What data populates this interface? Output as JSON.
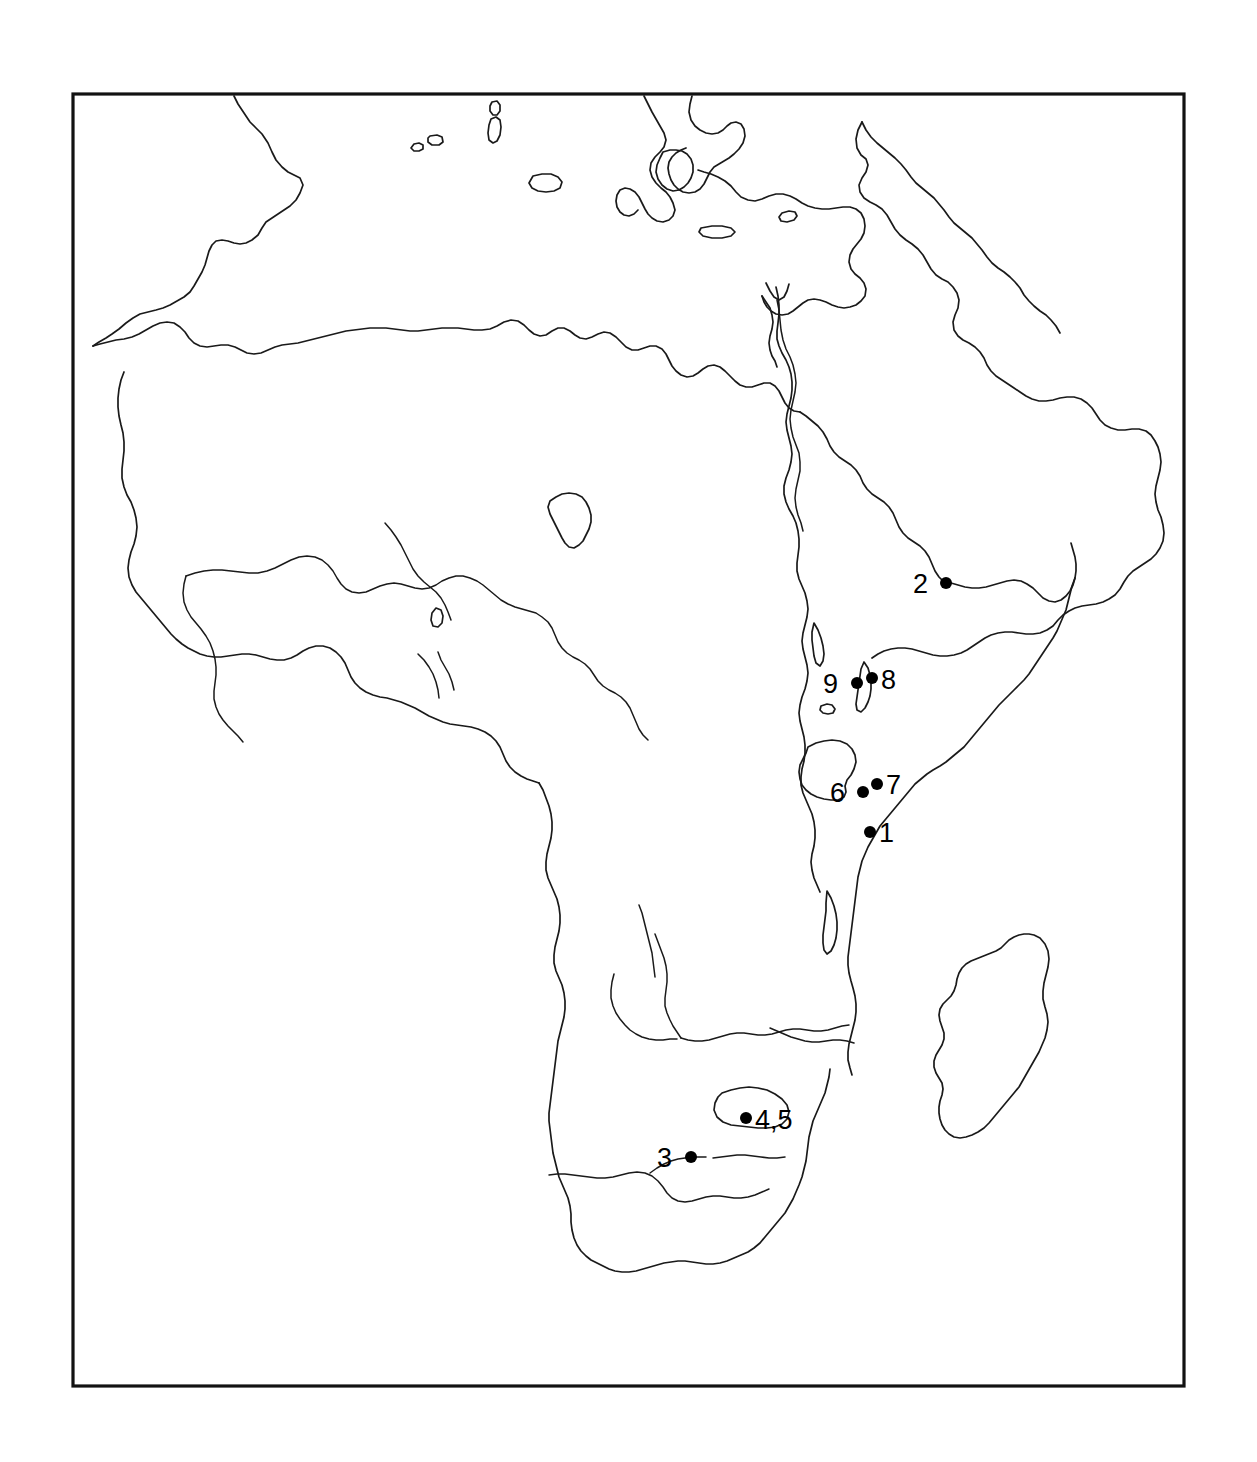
{
  "figure": {
    "frame": {
      "x": 73,
      "y": 94,
      "width": 1111,
      "height": 1292,
      "stroke_color": "#121212"
    },
    "background_color": "#ffffff",
    "line_color": "#1a1a1a"
  },
  "map": {
    "region": "Africa",
    "projection_style": "outline",
    "features": {
      "continents": [
        "Africa",
        "Arabia",
        "southern Europe",
        "Anatolia",
        "Levant"
      ],
      "islands": [
        "Madagascar",
        "Sicily",
        "Crete",
        "Cyprus",
        "Sardinia",
        "Corsica",
        "Balearics"
      ],
      "lakes": [
        "Lake Chad",
        "Lake Victoria",
        "Lake Tanganyika",
        "Lake Malawi",
        "Lake Turkana",
        "Lake Kyoga"
      ],
      "rivers": [
        "Nile",
        "Niger",
        "Congo",
        "Zambezi",
        "Orange",
        "Limpopo"
      ]
    }
  },
  "sites": [
    {
      "id": "site-1",
      "label": "1",
      "dot_x": 870,
      "dot_y": 832,
      "label_x": 879,
      "label_y": 842,
      "label_side": "right"
    },
    {
      "id": "site-2",
      "label": "2",
      "dot_x": 946,
      "dot_y": 583,
      "label_x": 928,
      "label_y": 593,
      "label_side": "left"
    },
    {
      "id": "site-3",
      "label": "3",
      "dot_x": 691,
      "dot_y": 1157,
      "label_x": 672,
      "label_y": 1167,
      "label_side": "left"
    },
    {
      "id": "site-4-5",
      "label": "4,5",
      "dot_x": 746,
      "dot_y": 1118,
      "label_x": 755,
      "label_y": 1129,
      "label_side": "right"
    },
    {
      "id": "site-6",
      "label": "6",
      "dot_x": 863,
      "dot_y": 792,
      "label_x": 845,
      "label_y": 802,
      "label_side": "left"
    },
    {
      "id": "site-7",
      "label": "7",
      "dot_x": 877,
      "dot_y": 784,
      "label_x": 886,
      "label_y": 794,
      "label_side": "right"
    },
    {
      "id": "site-8",
      "label": "8",
      "dot_x": 872,
      "dot_y": 678,
      "label_x": 881,
      "label_y": 689,
      "label_side": "right"
    },
    {
      "id": "site-9",
      "label": "9",
      "dot_x": 857,
      "dot_y": 683,
      "label_x": 838,
      "label_y": 693,
      "label_side": "left"
    }
  ],
  "style": {
    "dot_radius": 6,
    "label_font_size": 27,
    "coast_stroke_width": 1.7,
    "frame_stroke_width": 3.2
  }
}
